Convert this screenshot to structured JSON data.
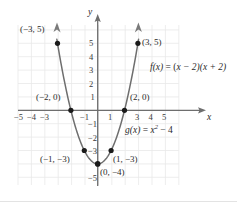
{
  "figure": {
    "background_color": "#ffffff",
    "curve_color": "#6e6e6e",
    "axis_color": "#6e6e6e",
    "grid_color": "#e6e6e6",
    "point_color": "#1a1a1a",
    "text_color": "#2b2b2b"
  },
  "axes": {
    "x_axis_label": "x",
    "y_axis_label": "y",
    "x_ticks": [
      "−5",
      "−4",
      "−3",
      "−1",
      "1",
      "3",
      "4",
      "5"
    ],
    "y_ticks": [
      "5",
      "4",
      "3",
      "2",
      "1",
      "−1",
      "−2",
      "−3",
      "−5"
    ],
    "x_range": [
      -6,
      6
    ],
    "y_range": [
      -6,
      6
    ]
  },
  "equations": {
    "f": "f(x) = (x − 2)(x + 2)",
    "f_name": "f",
    "f_arg": "(x)",
    "f_eq": " = (",
    "f_rest": "x − 2)(x + 2)",
    "g": "g(x) = x² − 4",
    "g_name": "g",
    "g_arg": "(x)",
    "g_eq": " = ",
    "g_var": "x",
    "g_exp": "2",
    "g_tail": " − 4"
  },
  "points": [
    {
      "label": "(−3, 5)",
      "x": -3,
      "y": 5
    },
    {
      "label": "(3, 5)",
      "x": 3,
      "y": 5
    },
    {
      "label": "(−2, 0)",
      "x": -2,
      "y": 0
    },
    {
      "label": "(2, 0)",
      "x": 2,
      "y": 0
    },
    {
      "label": "(−1, −3)",
      "x": -1,
      "y": -3
    },
    {
      "label": "(1, −3)",
      "x": 1,
      "y": -3
    },
    {
      "label": "(0, −4)",
      "x": 0,
      "y": -4
    }
  ],
  "chart_data": {
    "type": "line",
    "title": "",
    "xlabel": "x",
    "ylabel": "y",
    "xlim": [
      -6,
      6
    ],
    "ylim": [
      -6,
      6
    ],
    "grid": true,
    "legend": "none",
    "series": [
      {
        "name": "g(x) = x^2 - 4",
        "equation": "y = x^2 - 4",
        "x": [
          -3,
          -2.5,
          -2,
          -1.5,
          -1,
          -0.5,
          0,
          0.5,
          1,
          1.5,
          2,
          2.5,
          3
        ],
        "y": [
          5,
          2.25,
          0,
          -1.75,
          -3,
          -3.75,
          -4,
          -3.75,
          -3,
          -1.75,
          0,
          2.25,
          5
        ]
      }
    ],
    "annotations": [
      {
        "text": "f(x) = (x − 2)(x + 2)",
        "x": 4.4,
        "y": 2.3
      },
      {
        "text": "g(x) = x² − 4",
        "x": 3.2,
        "y": -1.6
      }
    ],
    "marked_points": [
      {
        "label": "(−3, 5)",
        "x": -3,
        "y": 5
      },
      {
        "label": "(−2, 0)",
        "x": -2,
        "y": 0
      },
      {
        "label": "(−1, −3)",
        "x": -1,
        "y": -3
      },
      {
        "label": "(0, −4)",
        "x": 0,
        "y": -4
      },
      {
        "label": "(1, −3)",
        "x": 1,
        "y": -3
      },
      {
        "label": "(2, 0)",
        "x": 2,
        "y": 0
      },
      {
        "label": "(3, 5)",
        "x": 3,
        "y": 5
      }
    ]
  }
}
